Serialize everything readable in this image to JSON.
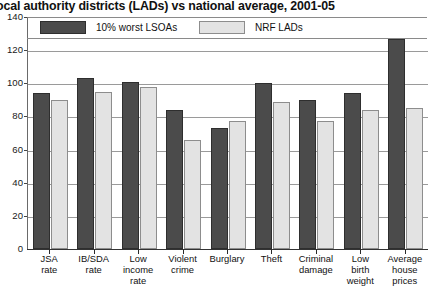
{
  "chart_data": {
    "type": "bar",
    "title": "ocal authority districts (LADs) vs national average, 2001-05",
    "xlabel": "",
    "ylabel": "",
    "ylim": [
      0,
      140
    ],
    "yticks": [
      0,
      20,
      40,
      60,
      80,
      100,
      120,
      140
    ],
    "ytick_labels": [
      "0",
      "20",
      "40",
      "60",
      "80",
      "100",
      "120",
      "140"
    ],
    "grid": true,
    "legend_position": "top-inside",
    "categories": [
      "JSA\nrate",
      "IB/SDA\nrate",
      "Low\nincome\nrate",
      "Violent\ncrime",
      "Burglary",
      "Theft",
      "Criminal\ndamage",
      "Low\nbirth\nweight",
      "Average\nhouse\nprices"
    ],
    "series": [
      {
        "name": "10% worst LSOAs",
        "color": "#4b4b4b",
        "values": [
          94,
          103,
          101,
          84,
          73,
          100,
          90,
          94,
          127
        ]
      },
      {
        "name": "NRF LADs",
        "color": "#e3e3e3",
        "values": [
          90,
          95,
          98,
          66,
          77,
          89,
          77,
          84,
          85
        ]
      }
    ]
  },
  "legend": {
    "items": [
      {
        "label": "10% worst LSOAs",
        "swatch": "dark"
      },
      {
        "label": "NRF LADs",
        "swatch": "light"
      }
    ]
  }
}
